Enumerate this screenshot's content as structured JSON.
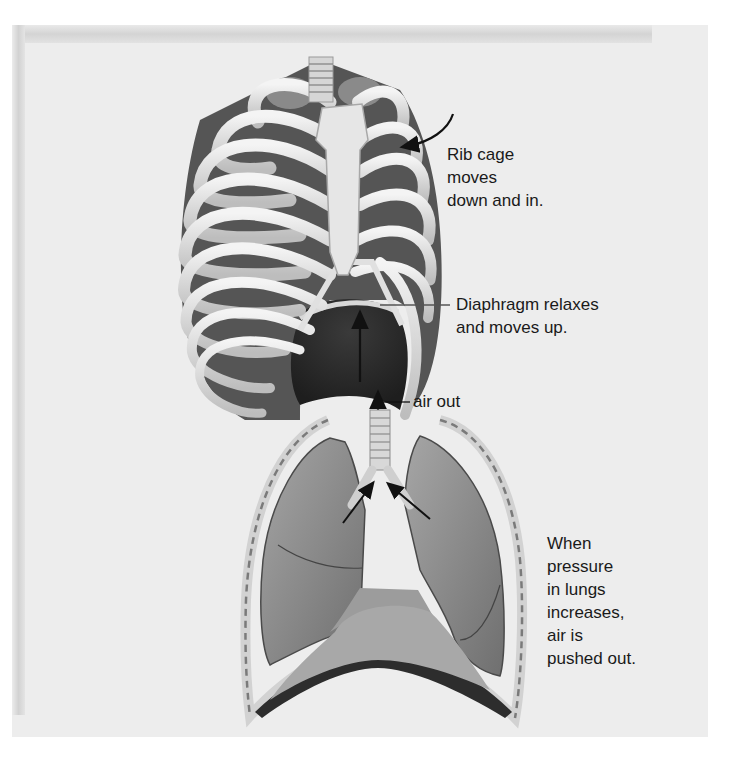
{
  "figure": {
    "labels": {
      "rib_cage": "Rib cage\nmoves\ndown and in.",
      "diaphragm": "Diaphragm relaxes\nand moves up.",
      "air_out": "air out",
      "pressure": "When\npressure\nin lungs\nincreases,\nair is\npushed out."
    },
    "parts": [
      "rib-cage",
      "sternum",
      "trachea",
      "diaphragm",
      "lungs",
      "bronchi",
      "chest-wall"
    ],
    "colors": {
      "background": "#ffffff",
      "panel": "#ededed",
      "bone": "#e4e4e4",
      "muscle": "#5c5c5c",
      "lung": "#8e8e8e",
      "diaphragm_dome": "#b5b5b5",
      "text": "#1a1a1a",
      "arrow": "#111111"
    }
  }
}
